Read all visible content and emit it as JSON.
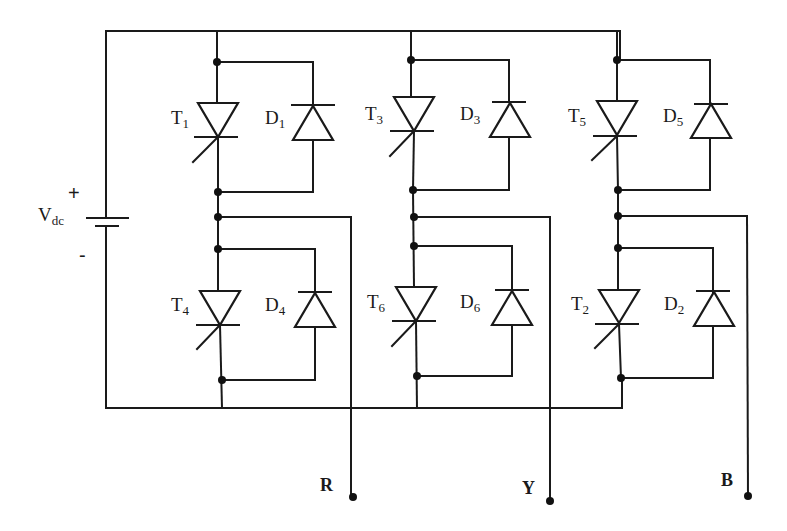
{
  "diagram": {
    "type": "three-phase-inverter",
    "source": {
      "label_main": "V",
      "label_sub": "dc",
      "plus": "+",
      "minus": "-"
    },
    "legs": [
      {
        "upper": {
          "thyristor": {
            "main": "T",
            "sub": "1"
          },
          "diode": {
            "main": "D",
            "sub": "1"
          }
        },
        "lower": {
          "thyristor": {
            "main": "T",
            "sub": "4"
          },
          "diode": {
            "main": "D",
            "sub": "4"
          }
        },
        "output": "R"
      },
      {
        "upper": {
          "thyristor": {
            "main": "T",
            "sub": "3"
          },
          "diode": {
            "main": "D",
            "sub": "3"
          }
        },
        "lower": {
          "thyristor": {
            "main": "T",
            "sub": "6"
          },
          "diode": {
            "main": "D",
            "sub": "6"
          }
        },
        "output": "Y"
      },
      {
        "upper": {
          "thyristor": {
            "main": "T",
            "sub": "5"
          },
          "diode": {
            "main": "D",
            "sub": "5"
          }
        },
        "lower": {
          "thyristor": {
            "main": "T",
            "sub": "2"
          },
          "diode": {
            "main": "D",
            "sub": "2"
          }
        },
        "output": "B"
      }
    ],
    "colors": {
      "line": "#1a1a1a",
      "background": "#ffffff"
    }
  }
}
